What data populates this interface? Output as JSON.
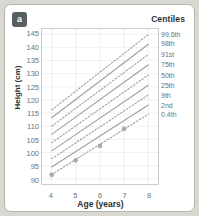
{
  "panel": {
    "badge": "a",
    "title": "Centiles"
  },
  "chart_data": {
    "type": "line",
    "title": "Centiles",
    "xlabel": "Age (years)",
    "ylabel": "Height (cm)",
    "xlim": [
      3.6,
      8.4
    ],
    "ylim": [
      88,
      147
    ],
    "grid": true,
    "legend_position": "right-of-axes",
    "x_ticks": [
      4,
      5,
      6,
      7,
      8
    ],
    "y_ticks": [
      90,
      95,
      100,
      105,
      110,
      115,
      120,
      125,
      130,
      135,
      140,
      145
    ],
    "series": [
      {
        "name": "99.6th",
        "style": "dashed",
        "x": [
          4,
          8
        ],
        "y": [
          116.2,
          144.9
        ]
      },
      {
        "name": "98th",
        "style": "solid",
        "x": [
          4,
          8
        ],
        "y": [
          113.2,
          141.2
        ]
      },
      {
        "name": "91st",
        "style": "dashed",
        "x": [
          4,
          8
        ],
        "y": [
          110.0,
          137.3
        ]
      },
      {
        "name": "75th",
        "style": "solid",
        "x": [
          4,
          8
        ],
        "y": [
          106.9,
          133.4
        ]
      },
      {
        "name": "50th",
        "style": "dashed",
        "x": [
          4,
          8
        ],
        "y": [
          103.7,
          129.5
        ]
      },
      {
        "name": "25th",
        "style": "solid",
        "x": [
          4,
          8
        ],
        "y": [
          100.6,
          125.6
        ]
      },
      {
        "name": "9th",
        "style": "dashed",
        "x": [
          4,
          8
        ],
        "y": [
          97.6,
          121.9
        ]
      },
      {
        "name": "2nd",
        "style": "solid",
        "x": [
          4,
          8
        ],
        "y": [
          94.5,
          118.1
        ]
      },
      {
        "name": "0.4th",
        "style": "dashed",
        "x": [
          4,
          8
        ],
        "y": [
          91.6,
          114.6
        ]
      }
    ],
    "measurements": {
      "name": "Child measurements",
      "marker": "circle",
      "x": [
        4,
        5,
        6,
        7
      ],
      "y": [
        91.5,
        97.0,
        102.5,
        109.0
      ]
    },
    "colors": {
      "line": "#9aa0a6",
      "marker": "#9aa0a6",
      "grid": "#ededeb",
      "axis": "#cfcdc8",
      "text": "#6d7377",
      "title": "#2c3033",
      "badge_bg": "#585f63",
      "card_bg": "#ffffff",
      "page_bg": "#d9d7d2"
    }
  }
}
